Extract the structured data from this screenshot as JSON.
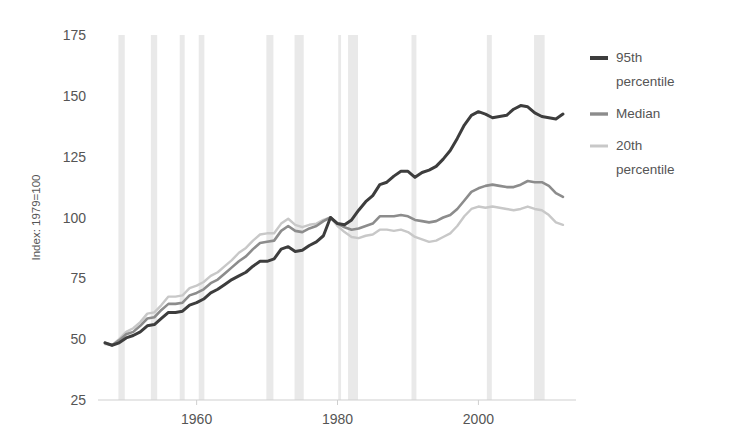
{
  "chart_data": {
    "type": "line",
    "title": "",
    "subtitle": "",
    "xlabel": "",
    "ylabel": "Index: 1979=100",
    "xlim": [
      1946,
      2013
    ],
    "ylim": [
      25,
      175
    ],
    "grid": false,
    "legend_position": "right",
    "y_ticks": [
      "25",
      "50",
      "75",
      "100",
      "125",
      "150",
      "175"
    ],
    "y_tick_values": [
      25,
      50,
      75,
      100,
      125,
      150,
      175
    ],
    "x_ticks": [
      "1960",
      "1980",
      "2000"
    ],
    "x_tick_values": [
      1960,
      1980,
      2000
    ],
    "x": [
      1947,
      1948,
      1949,
      1950,
      1951,
      1952,
      1953,
      1954,
      1955,
      1956,
      1957,
      1958,
      1959,
      1960,
      1961,
      1962,
      1963,
      1964,
      1965,
      1966,
      1967,
      1968,
      1969,
      1970,
      1971,
      1972,
      1973,
      1974,
      1975,
      1976,
      1977,
      1978,
      1979,
      1980,
      1981,
      1982,
      1983,
      1984,
      1985,
      1986,
      1987,
      1988,
      1989,
      1990,
      1991,
      1992,
      1993,
      1994,
      1995,
      1996,
      1997,
      1998,
      1999,
      2000,
      2001,
      2002,
      2003,
      2004,
      2005,
      2006,
      2007,
      2008,
      2009,
      2010,
      2011,
      2012
    ],
    "series": [
      {
        "name": "95th percentile",
        "color": "#3d3d3d",
        "values": [
          48.5,
          47.5,
          48.5,
          50.5,
          51.5,
          53.0,
          55.5,
          56.0,
          58.5,
          61.0,
          61.0,
          61.5,
          64.0,
          65.0,
          66.5,
          69.0,
          70.5,
          72.5,
          74.5,
          76.0,
          77.5,
          80.0,
          82.0,
          82.0,
          83.0,
          87.0,
          88.0,
          86.0,
          86.5,
          88.5,
          90.0,
          92.5,
          100.0,
          97.5,
          97.0,
          99.0,
          103.0,
          106.5,
          109.0,
          113.5,
          114.5,
          117.0,
          119.0,
          119.0,
          116.5,
          118.5,
          119.5,
          121.0,
          124.0,
          127.5,
          132.5,
          138.0,
          142.0,
          143.5,
          142.5,
          141.0,
          141.5,
          142.0,
          144.5,
          146.0,
          145.5,
          143.0,
          141.5,
          141.0,
          140.5,
          142.5
        ]
      },
      {
        "name": "Median",
        "color": "#8c8c8c",
        "values": [
          48.5,
          47.5,
          49.5,
          52.0,
          53.0,
          55.5,
          58.5,
          59.0,
          62.0,
          64.5,
          64.5,
          65.0,
          68.0,
          69.0,
          70.5,
          73.0,
          74.5,
          77.0,
          79.5,
          82.0,
          84.0,
          87.0,
          89.5,
          90.0,
          90.5,
          94.5,
          96.5,
          94.5,
          94.0,
          95.5,
          96.5,
          98.5,
          100.0,
          97.5,
          96.0,
          95.0,
          95.5,
          96.5,
          97.5,
          100.5,
          100.5,
          100.5,
          101.0,
          100.5,
          99.0,
          98.5,
          98.0,
          98.5,
          100.0,
          101.0,
          103.5,
          107.0,
          110.5,
          112.0,
          113.0,
          113.5,
          113.0,
          112.5,
          112.5,
          113.5,
          115.0,
          114.5,
          114.5,
          113.0,
          110.0,
          108.5
        ]
      },
      {
        "name": "20th percentile",
        "color": "#c8c8c8",
        "values": [
          48.0,
          47.5,
          50.0,
          53.0,
          54.5,
          57.0,
          60.5,
          61.0,
          64.0,
          67.5,
          67.5,
          68.0,
          71.0,
          72.0,
          73.5,
          76.0,
          77.5,
          80.0,
          82.5,
          85.5,
          87.5,
          90.5,
          93.0,
          93.5,
          93.5,
          97.5,
          99.5,
          97.0,
          96.0,
          97.0,
          97.5,
          99.0,
          100.0,
          96.5,
          94.0,
          92.0,
          91.5,
          92.5,
          93.0,
          95.0,
          95.0,
          94.5,
          95.0,
          94.0,
          92.0,
          91.0,
          90.0,
          90.5,
          92.0,
          93.5,
          96.5,
          100.5,
          103.5,
          104.5,
          104.0,
          104.5,
          104.0,
          103.5,
          103.0,
          103.5,
          104.5,
          103.5,
          103.0,
          101.0,
          98.0,
          97.0
        ]
      }
    ],
    "recession_bands": [
      {
        "start": 1948.9,
        "end": 1949.8
      },
      {
        "start": 1953.5,
        "end": 1954.4
      },
      {
        "start": 1957.6,
        "end": 1958.3
      },
      {
        "start": 1960.3,
        "end": 1961.1
      },
      {
        "start": 1969.9,
        "end": 1970.9
      },
      {
        "start": 1973.9,
        "end": 1975.2
      },
      {
        "start": 1980.1,
        "end": 1980.5
      },
      {
        "start": 1981.5,
        "end": 1982.9
      },
      {
        "start": 1990.5,
        "end": 1991.2
      },
      {
        "start": 2001.2,
        "end": 2001.9
      },
      {
        "start": 2007.9,
        "end": 2009.4
      }
    ],
    "recession_band_color": "#e9e9e9"
  },
  "legend": {
    "items": [
      {
        "label_line1": "95th",
        "label_line2": "percentile",
        "color": "#3d3d3d"
      },
      {
        "label_line1": "Median",
        "label_line2": "",
        "color": "#8c8c8c"
      },
      {
        "label_line1": "20th",
        "label_line2": "percentile",
        "color": "#c8c8c8"
      }
    ]
  }
}
